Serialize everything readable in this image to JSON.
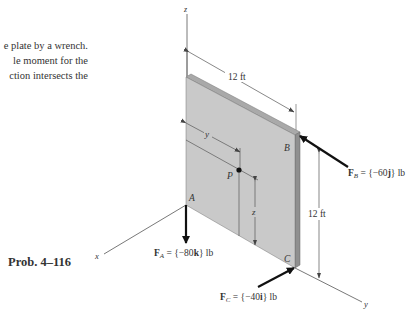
{
  "problem_text": {
    "lines": [
      "e plate by a wrench.",
      "le moment for the",
      "ction intersects the"
    ]
  },
  "caption": "Prob. 4–116",
  "axes": {
    "x": "x",
    "y": "y",
    "z": "z"
  },
  "points": {
    "A": "A",
    "B": "B",
    "C": "C",
    "P": "P"
  },
  "dimensions": {
    "width": "12 ft",
    "height": "12 ft",
    "y_coord": "y",
    "z_coord": "z"
  },
  "forces": {
    "FA": {
      "name": "F",
      "sub": "A",
      "value": " = {−80",
      "unit_vec": "k",
      "tail": "} lb"
    },
    "FB": {
      "name": "F",
      "sub": "B",
      "value": " = {−60",
      "unit_vec": "j",
      "tail": "} lb"
    },
    "FC": {
      "name": "F",
      "sub": "C",
      "value": " = {−40",
      "unit_vec": "i",
      "tail": "} lb"
    }
  },
  "colors": {
    "plate_face": "#c9c9c9",
    "plate_edge": "#a9a9a9",
    "plate_edge_dark": "#8f8f8f",
    "line": "#444444",
    "arrow": "#111111"
  }
}
